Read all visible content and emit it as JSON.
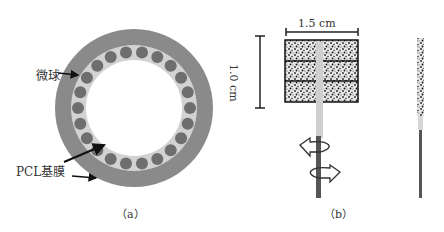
{
  "panel_a": {
    "caption": "（a）",
    "labels": {
      "microsphere": "微球",
      "pcl_membrane": "PCL基膜"
    },
    "colors": {
      "outer_ring": "#8a8a8a",
      "inner_ring": "#d0d0d0",
      "microsphere": "#6e6e6e",
      "background": "#ffffff"
    },
    "microsphere_count": 22
  },
  "panel_b": {
    "caption": "（b）",
    "dimensions": {
      "width": "1.5 cm",
      "height": "1.0 cm"
    }
  }
}
